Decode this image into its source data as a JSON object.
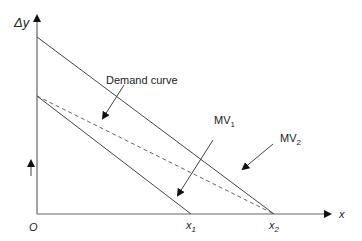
{
  "diagram": {
    "y_axis_label": "Δy",
    "x_axis_label": "x",
    "origin_label": "O",
    "x_ticks": [
      {
        "base": "x",
        "sub": "1"
      },
      {
        "base": "x",
        "sub": "2"
      }
    ],
    "curves": [
      {
        "name": "MV₁",
        "base": "MV",
        "sub": "1",
        "style": "solid"
      },
      {
        "name": "MV₂",
        "base": "MV",
        "sub": "2",
        "style": "solid"
      },
      {
        "name": "Demand curve",
        "style": "dashed"
      }
    ],
    "annotations": {
      "demand": "Demand curve",
      "mv1_base": "MV",
      "mv1_sub": "1",
      "mv2_base": "MV",
      "mv2_sub": "2"
    },
    "colors": {
      "line": "#444444",
      "axis": "#555555",
      "text": "#222222"
    }
  }
}
